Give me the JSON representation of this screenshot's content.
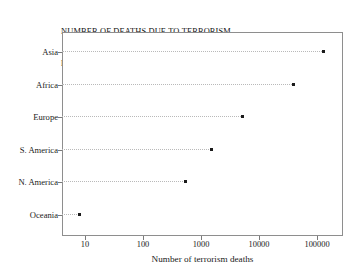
{
  "chart_data": {
    "type": "scatter",
    "title": "NUMBER OF DEATHS DUE TO TERRORISM\nBY CONTINENT (2002-2017)",
    "title_line1": "NUMBER OF DEATHS DUE TO TERRORISM",
    "title_line2": "BY CONTINENT (2002-2017)",
    "xlabel": "Number of terrorism deaths",
    "ylabel": "",
    "xscale": "log",
    "xlim": [
      6,
      250000
    ],
    "grid": false,
    "legend": null,
    "xticks": [
      10,
      100,
      1000,
      10000,
      100000
    ],
    "xticklabels": [
      "10",
      "100",
      "1000",
      "10000",
      "100000"
    ],
    "categories": [
      "Asia",
      "Africa",
      "Europe",
      "S. America",
      "N. America",
      "Oceania"
    ],
    "values": [
      130000,
      40000,
      5200,
      1500,
      530,
      8
    ],
    "points": [
      {
        "label": "Asia",
        "value": 130000
      },
      {
        "label": "Africa",
        "value": 40000
      },
      {
        "label": "Europe",
        "value": 5200
      },
      {
        "label": "S. America",
        "value": 1500
      },
      {
        "label": "N. America",
        "value": 530
      },
      {
        "label": "Oceania",
        "value": 8
      }
    ],
    "marker_color": "#1b1b1b",
    "connector_color": "#b9b9b9",
    "frame_color": "#8e8e8e"
  }
}
